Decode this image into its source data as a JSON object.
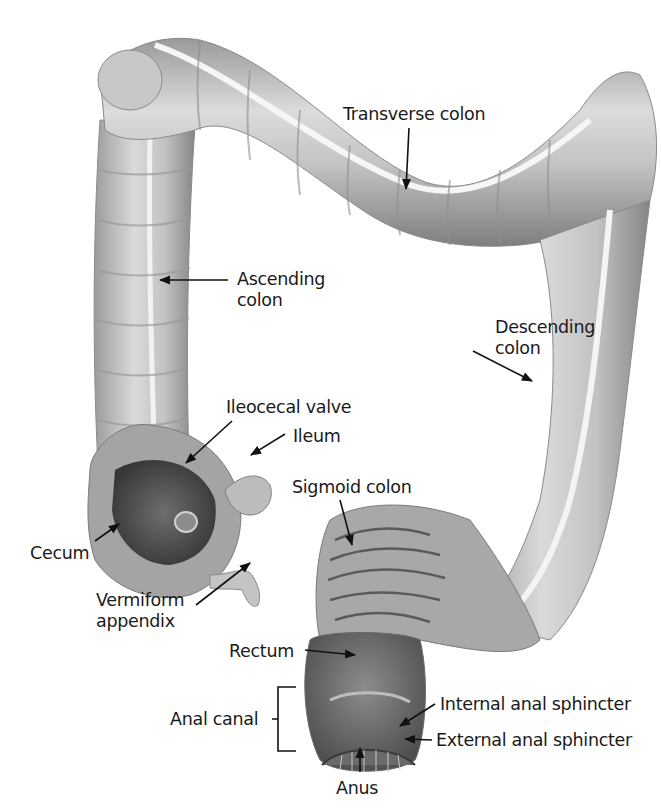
{
  "figure": {
    "background": "#ffffff",
    "tissue_colors": {
      "light": "#e6e6e6",
      "mid": "#b4b4b4",
      "dark": "#6a6a6a",
      "interior": "#4a4a4a",
      "band": "#f4f4f4"
    }
  },
  "labels": {
    "transverse_colon": "Transverse colon",
    "ascending_colon_1": "Ascending",
    "ascending_colon_2": "colon",
    "descending_colon_1": "Descending",
    "descending_colon_2": "colon",
    "ileocecal_valve": "Ileocecal valve",
    "ileum": "Ileum",
    "sigmoid_colon": "Sigmoid colon",
    "cecum": "Cecum",
    "vermiform_appendix_1": "Vermiform",
    "vermiform_appendix_2": "appendix",
    "rectum": "Rectum",
    "anal_canal": "Anal canal",
    "internal_anal_sphincter": "Internal anal sphincter",
    "external_anal_sphincter": "External anal sphincter",
    "anus": "Anus"
  }
}
